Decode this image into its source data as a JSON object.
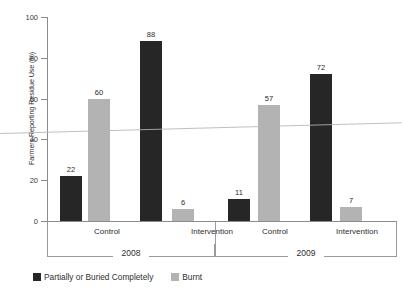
{
  "chart_data": {
    "type": "bar",
    "title": "",
    "xlabel": "",
    "ylabel": "Farmers Reporting Residue Use (%)",
    "ylim": [
      0,
      100
    ],
    "ytick_labels": [
      "100",
      "80",
      "60",
      "40",
      "20",
      "0"
    ],
    "ytick_values": [
      100,
      80,
      60,
      40,
      20,
      0
    ],
    "grid": false,
    "legend_position": "bottom-left",
    "categories": [
      "Control",
      "Intervention",
      "Control",
      "Intervention"
    ],
    "groups": [
      {
        "year": "2008",
        "categories": [
          "Control",
          "Intervention"
        ]
      },
      {
        "year": "2009",
        "categories": [
          "Control",
          "Intervention"
        ]
      }
    ],
    "series": [
      {
        "name": "Partially or Buried Completely",
        "color": "#262626",
        "values": [
          22,
          88,
          11,
          72
        ]
      },
      {
        "name": "Burnt",
        "color": "#b3b3b3",
        "values": [
          60,
          6,
          57,
          7
        ]
      }
    ],
    "bars": [
      {
        "group": "2008",
        "category": "Control",
        "series": "Partially or Buried Completely",
        "value": 22,
        "label": "22",
        "color": "#262626"
      },
      {
        "group": "2008",
        "category": "Control",
        "series": "Burnt",
        "value": 60,
        "label": "60",
        "color": "#b3b3b3"
      },
      {
        "group": "2008",
        "category": "Intervention",
        "series": "Partially or Buried Completely",
        "value": 88,
        "label": "88",
        "color": "#262626"
      },
      {
        "group": "2008",
        "category": "Intervention",
        "series": "Burnt",
        "value": 6,
        "label": "6",
        "color": "#b3b3b3"
      },
      {
        "group": "2009",
        "category": "Control",
        "series": "Partially or Buried Completely",
        "value": 11,
        "label": "11",
        "color": "#262626"
      },
      {
        "group": "2009",
        "category": "Control",
        "series": "Burnt",
        "value": 57,
        "label": "57",
        "color": "#b3b3b3"
      },
      {
        "group": "2009",
        "category": "Intervention",
        "series": "Partially or Buried Completely",
        "value": 72,
        "label": "72",
        "color": "#262626"
      },
      {
        "group": "2009",
        "category": "Intervention",
        "series": "Burnt",
        "value": 7,
        "label": "7",
        "color": "#b3b3b3"
      }
    ]
  },
  "axis": {
    "y_title": "Farmers Reporting Residue Use (%)",
    "ticks": [
      {
        "label": "100",
        "value": 100
      },
      {
        "label": "80",
        "value": 80
      },
      {
        "label": "60",
        "value": 60
      },
      {
        "label": "40",
        "value": 40
      },
      {
        "label": "20",
        "value": 20
      },
      {
        "label": "0",
        "value": 0
      }
    ]
  },
  "groups": [
    {
      "label": "Control"
    },
    {
      "label": "Intervention"
    },
    {
      "label": "Control"
    },
    {
      "label": "Intervention"
    }
  ],
  "years": [
    {
      "label": "2008"
    },
    {
      "label": "2009"
    }
  ],
  "legend": {
    "items": [
      {
        "label": "Partially or Buried Completely",
        "color": "#262626"
      },
      {
        "label": "Burnt",
        "color": "#b3b3b3"
      }
    ]
  }
}
